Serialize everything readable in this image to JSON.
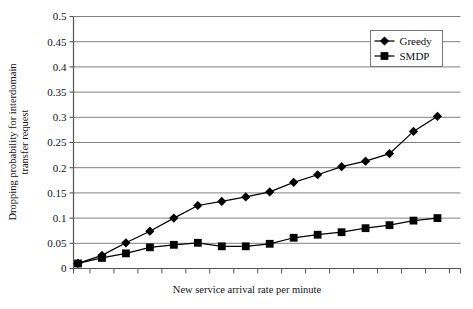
{
  "chart_data": {
    "type": "line",
    "title": "",
    "xlabel": "New service arrival rate per minute",
    "ylabel": "Dropping probability for interdomain transfer request",
    "ylabel_line1": "Dropping probability for interdomain",
    "ylabel_line2": "transfer request",
    "ylim": [
      0,
      0.5
    ],
    "ytick_step": 0.05,
    "ytick_labels": [
      "0",
      "0.05",
      "0.1",
      "0.15",
      "0.2",
      "0.25",
      "0.3",
      "0.35",
      "0.4",
      "0.45",
      "0.5"
    ],
    "ytick_values": [
      0,
      0.05,
      0.1,
      0.15,
      0.2,
      0.25,
      0.3,
      0.35,
      0.4,
      0.45,
      0.5
    ],
    "xtick_labels": [
      "",
      "",
      "",
      "",
      "",
      "",
      "",
      "",
      "",
      "",
      "",
      "",
      "",
      "",
      "",
      ""
    ],
    "x_index": [
      0,
      1,
      2,
      3,
      4,
      5,
      6,
      7,
      8,
      9,
      10,
      11,
      12,
      13,
      14,
      15
    ],
    "n_points": 16,
    "grid": "horizontal",
    "legend_position": "top-right",
    "series": [
      {
        "name": "Greedy",
        "marker": "diamond",
        "color": "#000000",
        "values": [
          0.01,
          0.026,
          0.051,
          0.074,
          0.1,
          0.125,
          0.133,
          0.142,
          0.152,
          0.171,
          0.186,
          0.202,
          0.213,
          0.228,
          0.272,
          0.302
        ]
      },
      {
        "name": "SMDP",
        "marker": "square",
        "color": "#000000",
        "values": [
          0.01,
          0.021,
          0.03,
          0.042,
          0.047,
          0.051,
          0.044,
          0.044,
          0.049,
          0.061,
          0.067,
          0.072,
          0.08,
          0.086,
          0.095,
          0.1
        ]
      }
    ]
  },
  "legend": {
    "entries": [
      {
        "label": "Greedy"
      },
      {
        "label": "SMDP"
      }
    ]
  },
  "axes": {
    "x_title": "New service arrival rate per minute",
    "y_title_line1": "Dropping probability for interdomain",
    "y_title_line2": "transfer request"
  },
  "colors": {
    "line": "#000000",
    "grid": "#808080",
    "axis": "#666666",
    "text": "#111111",
    "background": "#ffffff"
  }
}
